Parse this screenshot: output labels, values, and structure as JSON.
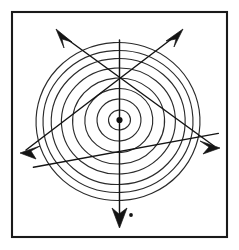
{
  "figure": {
    "title": "Polar coordinate grid diagram",
    "background_color": "#ffffff",
    "frame": {
      "name": "outer-border",
      "stroke_color": "#1a1a1a",
      "stroke_width": 2.1,
      "x": 11,
      "y": 11,
      "width": 217,
      "height": 227
    },
    "origin": {
      "label": "origin",
      "x": 119,
      "y": 120,
      "dot_radius": 3.1,
      "color": "#111111"
    },
    "rings": {
      "name": "concentric-circles",
      "count": 8,
      "stroke_color": "#2b2b2b",
      "stroke_width": 1.15,
      "radii": [
        11,
        22,
        34,
        46,
        57,
        67,
        75,
        82
      ],
      "radii_y": [
        10,
        21,
        32,
        43,
        53,
        63,
        71,
        79
      ]
    },
    "spokes": {
      "name": "radial-spokes",
      "count": 8,
      "stroke_color": "#2b2b2b",
      "angles_deg": [
        0,
        45,
        90,
        135,
        180,
        225,
        270,
        315
      ],
      "diameter_lines": 4
    },
    "arrows": [
      {
        "name": "arrow-up-left",
        "direction": "up-left",
        "angle_deg": 128,
        "tip_x": 56,
        "tip_y": 30,
        "has_head": true
      },
      {
        "name": "arrow-up-right",
        "direction": "up-right",
        "angle_deg": 52,
        "tip_x": 182,
        "tip_y": 30,
        "has_head": true
      },
      {
        "name": "arrow-down-left",
        "direction": "down-left",
        "angle_deg": 205,
        "tip_x": 21,
        "tip_y": 153,
        "has_head": true
      },
      {
        "name": "arrow-down-right",
        "direction": "down-right",
        "angle_deg": 25,
        "tip_x": 218,
        "tip_y": 148,
        "has_head": true
      },
      {
        "name": "arrow-down",
        "direction": "down",
        "angle_deg": 270,
        "tip_x": 119,
        "tip_y": 226,
        "has_head": true
      }
    ],
    "stray_mark": {
      "name": "ink-dot",
      "x": 131,
      "y": 215,
      "radius": 1.9,
      "color": "#141414"
    }
  }
}
